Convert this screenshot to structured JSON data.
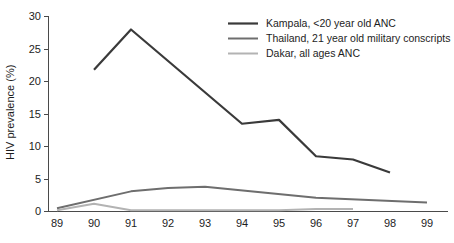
{
  "chart_data": {
    "type": "line",
    "title": "",
    "xlabel": "",
    "ylabel": "HIV prevalence (%)",
    "xlim": [
      89,
      99
    ],
    "ylim": [
      0,
      30
    ],
    "grid": false,
    "legend_position": "top-right",
    "x_ticks": [
      "89",
      "90",
      "91",
      "92",
      "93",
      "94",
      "95",
      "96",
      "97",
      "98",
      "99"
    ],
    "y_ticks": [
      "0",
      "5",
      "10",
      "15",
      "20",
      "25",
      "30"
    ],
    "series": [
      {
        "name": "Kampala, <20 year old ANC",
        "color": "#3a3a3a",
        "x": [
          90,
          91,
          94,
          95,
          96,
          97,
          98
        ],
        "values": [
          21.8,
          28.0,
          13.5,
          14.1,
          8.5,
          8.0,
          6.0
        ]
      },
      {
        "name": "Thailand, 21 year old military conscripts",
        "color": "#6e6e6e",
        "x": [
          89,
          91,
          92,
          93,
          96,
          99
        ],
        "values": [
          0.5,
          3.1,
          3.6,
          3.8,
          2.1,
          1.4
        ]
      },
      {
        "name": "Dakar, all ages ANC",
        "color": "#b3b3b3",
        "x": [
          89,
          90,
          91,
          95,
          96,
          97
        ],
        "values": [
          0.2,
          1.2,
          0.2,
          0.2,
          0.4,
          0.4
        ]
      }
    ]
  },
  "axes": {
    "y_title": "HIV prevalence (%)",
    "y_tick_labels": [
      "30",
      "25",
      "20",
      "15",
      "10",
      "5",
      "0"
    ],
    "x_tick_labels": [
      "89",
      "90",
      "91",
      "92",
      "93",
      "94",
      "95",
      "96",
      "97",
      "98",
      "99"
    ]
  },
  "legend": {
    "entries": [
      {
        "label": "Kampala, <20 year old ANC",
        "color": "#3a3a3a"
      },
      {
        "label": "Thailand, 21 year old military conscripts",
        "color": "#6e6e6e"
      },
      {
        "label": "Dakar, all ages ANC",
        "color": "#b3b3b3"
      }
    ]
  }
}
